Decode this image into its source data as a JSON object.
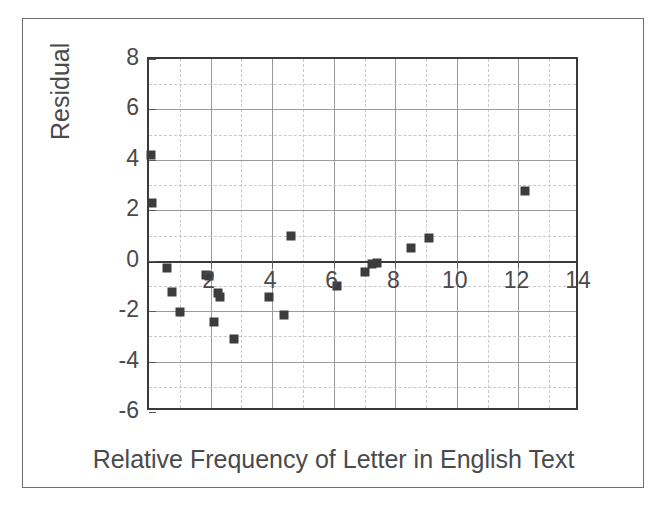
{
  "chart_data": {
    "type": "scatter",
    "title": "",
    "xlabel": "Relative Frequency of Letter in English Text",
    "ylabel": "Residual",
    "xlim": [
      0,
      14
    ],
    "ylim": [
      -6,
      8
    ],
    "xticks": [
      0,
      2,
      4,
      6,
      8,
      10,
      12,
      14
    ],
    "xtick_labels": [
      "",
      "2",
      "4",
      "6",
      "8",
      "10",
      "12",
      "14"
    ],
    "yticks": [
      -6,
      -4,
      -2,
      0,
      2,
      4,
      6,
      8
    ],
    "ytick_labels": [
      "-6",
      "-4",
      "-2",
      "0",
      "2",
      "4",
      "6",
      "8"
    ],
    "x_minor_step": 1,
    "y_minor_step": 1,
    "grid": "major solid gray, minor dashed light gray",
    "legend": "none",
    "marker_style": "filled square",
    "marker_color": "#3c3c3e",
    "zero_reference_line": 0,
    "points": [
      {
        "x": 0.08,
        "y": 4.2
      },
      {
        "x": 0.1,
        "y": 2.3
      },
      {
        "x": 0.6,
        "y": -0.3
      },
      {
        "x": 0.75,
        "y": -1.25
      },
      {
        "x": 1.0,
        "y": -2.05
      },
      {
        "x": 1.85,
        "y": -0.55
      },
      {
        "x": 1.95,
        "y": -0.6
      },
      {
        "x": 2.1,
        "y": -2.45
      },
      {
        "x": 2.25,
        "y": -1.3
      },
      {
        "x": 2.3,
        "y": -1.45
      },
      {
        "x": 2.75,
        "y": -3.1
      },
      {
        "x": 3.9,
        "y": -1.45
      },
      {
        "x": 4.4,
        "y": -2.15
      },
      {
        "x": 4.6,
        "y": 1.0
      },
      {
        "x": 6.1,
        "y": -1.0
      },
      {
        "x": 7.0,
        "y": -0.45
      },
      {
        "x": 7.25,
        "y": -0.15
      },
      {
        "x": 7.4,
        "y": -0.1
      },
      {
        "x": 8.5,
        "y": 0.5
      },
      {
        "x": 9.1,
        "y": 0.9
      },
      {
        "x": 12.2,
        "y": 2.75
      }
    ]
  },
  "colors": {
    "outer_border": "#6e6e70",
    "axis": "#3a3a3c",
    "grid_major": "#9a9a9c",
    "grid_minor": "#c9c9cb",
    "marker": "#3c3c3e",
    "text": "#4a4a4c",
    "background": "#ffffff"
  }
}
